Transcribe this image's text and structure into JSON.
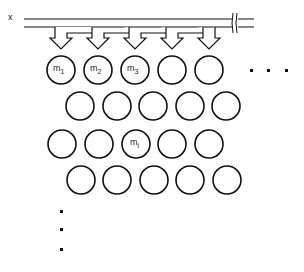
{
  "diagram": {
    "input_label": "x",
    "stroke_color": "#111111",
    "background": "#ffffff",
    "bus": {
      "break_symbol": "break-marks"
    },
    "arrows": {
      "count": 5
    },
    "rows": [
      {
        "cells": [
          {
            "label": "m",
            "sub": "1"
          },
          {
            "label": "m",
            "sub": "2"
          },
          {
            "label": "m",
            "sub": "3"
          },
          {
            "label": "",
            "sub": ""
          },
          {
            "label": "",
            "sub": ""
          }
        ],
        "trailing": "· · ·"
      },
      {
        "cells": [
          {
            "label": "",
            "sub": ""
          },
          {
            "label": "",
            "sub": ""
          },
          {
            "label": "",
            "sub": ""
          },
          {
            "label": "",
            "sub": ""
          },
          {
            "label": "",
            "sub": ""
          }
        ]
      },
      {
        "cells": [
          {
            "label": "",
            "sub": ""
          },
          {
            "label": "",
            "sub": ""
          },
          {
            "label": "m",
            "sub": "i"
          },
          {
            "label": "",
            "sub": ""
          },
          {
            "label": "",
            "sub": ""
          }
        ]
      },
      {
        "cells": [
          {
            "label": "",
            "sub": ""
          },
          {
            "label": "",
            "sub": ""
          },
          {
            "label": "",
            "sub": ""
          },
          {
            "label": "",
            "sub": ""
          },
          {
            "label": "",
            "sub": ""
          }
        ]
      }
    ],
    "vertical_ellipsis": "⋮"
  }
}
